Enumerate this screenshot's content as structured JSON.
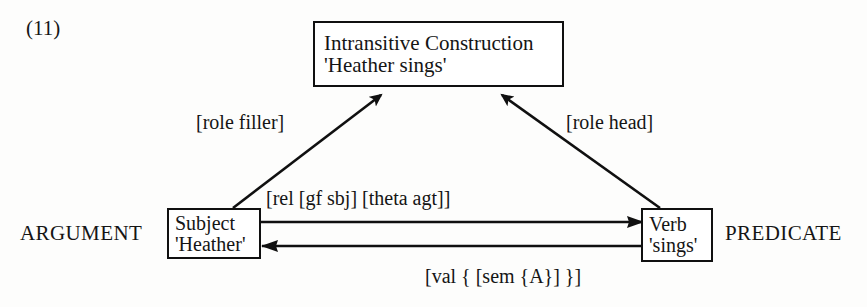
{
  "figure": {
    "number": "(11)",
    "caption_labels": {
      "left_role": "ARGUMENT",
      "right_role": "PREDICATE"
    }
  },
  "nodes": [
    {
      "id": "construction",
      "line1": "Intransitive Construction",
      "line2": "'Heather sings'"
    },
    {
      "id": "subject",
      "line1": "Subject",
      "line2": "'Heather'"
    },
    {
      "id": "verb",
      "line1": "Verb",
      "line2": "'sings'"
    }
  ],
  "edge_labels": {
    "role_filler": "[role  filler]",
    "role_head": "[role head]",
    "relation": "[rel  [gf  sbj]  [theta  agt]]",
    "valence": "[val {  [sem {A}]  }]"
  },
  "colors": {
    "ink": "#101010",
    "page": "#fdfdfc"
  }
}
